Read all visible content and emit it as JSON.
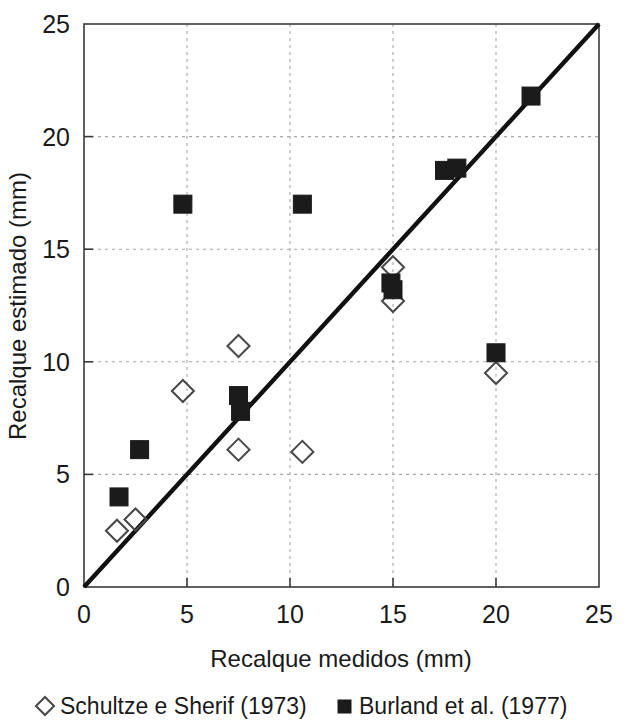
{
  "chart_data": {
    "type": "scatter",
    "title": "",
    "xlabel": "Recalque medidos (mm)",
    "ylabel": "Recalque estimado (mm)",
    "xlim": [
      0,
      25
    ],
    "ylim": [
      0,
      25
    ],
    "xticks": [
      0,
      5,
      10,
      15,
      20,
      25
    ],
    "yticks": [
      0,
      5,
      10,
      15,
      20,
      25
    ],
    "xtick_labels": [
      "0",
      "5",
      "10",
      "15",
      "20",
      "25"
    ],
    "ytick_labels": [
      "0",
      "5",
      "10",
      "15",
      "20",
      "25"
    ],
    "grid": true,
    "grid_style": "dotted",
    "legend_position": "below-plot",
    "reference_line": {
      "name": "linha 1:1",
      "from": [
        0,
        0
      ],
      "to": [
        25,
        25
      ],
      "color": "#111111"
    },
    "series": [
      {
        "name": "Schultze e Sherif (1973)",
        "marker": "open-diamond",
        "color": "#4a4a4a",
        "points": [
          [
            1.6,
            2.5
          ],
          [
            2.5,
            3.0
          ],
          [
            4.8,
            8.7
          ],
          [
            7.5,
            10.7
          ],
          [
            7.5,
            6.1
          ],
          [
            10.6,
            6.0
          ],
          [
            15.0,
            14.2
          ],
          [
            15.0,
            12.7
          ],
          [
            20.0,
            9.5
          ]
        ]
      },
      {
        "name": "Burland et al. (1977)",
        "marker": "filled-square",
        "color": "#1b1b1b",
        "points": [
          [
            1.7,
            4.0
          ],
          [
            2.7,
            6.1
          ],
          [
            4.8,
            17.0
          ],
          [
            7.5,
            8.5
          ],
          [
            7.6,
            7.8
          ],
          [
            10.6,
            17.0
          ],
          [
            14.9,
            13.5
          ],
          [
            15.0,
            13.2
          ],
          [
            17.5,
            18.5
          ],
          [
            18.1,
            18.6
          ],
          [
            20.0,
            10.4
          ],
          [
            21.7,
            21.8
          ]
        ]
      }
    ]
  },
  "axes": {
    "x_title": "Recalque medidos (mm)",
    "y_title": "Recalque estimado (mm)"
  },
  "legend": {
    "entries": [
      {
        "label": "Schultze e Sherif (1973)",
        "marker": "open-diamond"
      },
      {
        "label": "Burland et al. (1977)",
        "marker": "filled-square"
      }
    ]
  }
}
